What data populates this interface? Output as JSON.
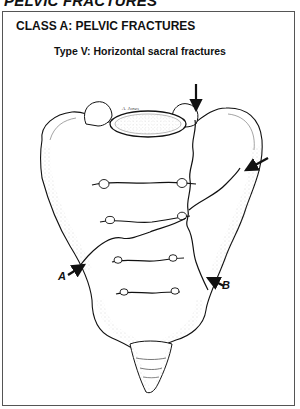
{
  "page": {
    "heading": "PELVIC FRACTURES"
  },
  "panel": {
    "class_title": "CLASS A: PELVIC FRACTURES",
    "type_title": "Type V: Horizontal sacral fractures"
  },
  "illustration": {
    "subject": "Sacrum with horizontal fracture lines (anterior view)",
    "signature": "A. Jones",
    "arrows": [
      {
        "name": "top-arrow",
        "label": "",
        "target": "superior fracture at S1 facet"
      },
      {
        "name": "right-arrow",
        "label": "",
        "target": "lateral fracture line, right ala"
      },
      {
        "name": "arrow-a",
        "label": "A",
        "target": "horizontal fracture, left margin"
      },
      {
        "name": "arrow-b",
        "label": "B",
        "target": "horizontal fracture, right margin"
      }
    ]
  },
  "colors": {
    "ink": "#111111",
    "frame": "#555555",
    "shade": "#bdbdbd",
    "background": "#ffffff"
  }
}
